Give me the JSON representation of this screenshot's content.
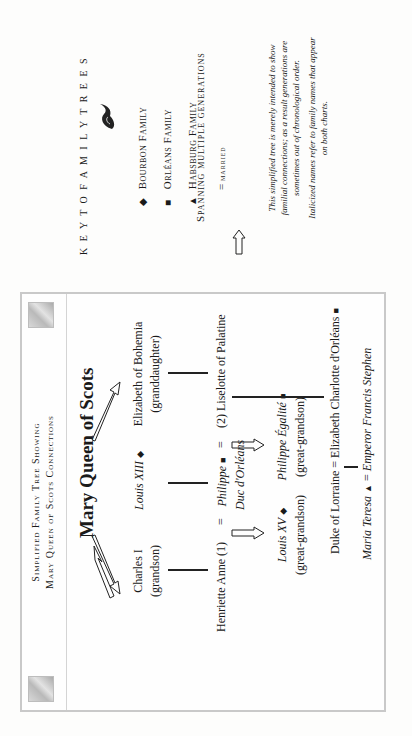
{
  "chart": {
    "title_line1": "Simplified Family Tree Showing",
    "title_line2": "Mary Queen of Scots Connections",
    "root": "Mary Queen of Scots",
    "people": {
      "charles": {
        "name": "Charles I",
        "relation": "(grandson)"
      },
      "louis13": {
        "name": "Louis XIII",
        "symbol": "◆"
      },
      "elizabeth_bohemia": {
        "name": "Elizabeth of Bohemia",
        "relation": "(granddaughter)"
      },
      "henriette": {
        "name": "Henriette Anne (1)"
      },
      "philippe": {
        "name": "Philippe",
        "symbol": "■",
        "title": "Duc d'Orléans"
      },
      "liselotte": {
        "name": "(2) Liselotte of Palatine"
      },
      "louis15": {
        "name": "Louis XV",
        "symbol": "◆",
        "relation": "(great-grandson)"
      },
      "philippe_egalite": {
        "name": "Philippe Égalité",
        "symbol": "■",
        "relation": "(great-grandson)"
      },
      "duke_lorraine": {
        "name": "Duke of Lorraine"
      },
      "elizabeth_charlotte": {
        "name": "Elizabeth Charlotte d'Orléans",
        "symbol": "■"
      },
      "maria_teresa": {
        "name": "Maria Teresa",
        "symbol": "▲"
      },
      "francis_stephen": {
        "name": "Emperor Francis Stephen"
      }
    },
    "married_sign": "="
  },
  "legend": {
    "title": "K E Y   T O   F A M I L Y   T R E E S",
    "items": [
      {
        "symbol": "◆",
        "label": "Bourbon Family"
      },
      {
        "symbol": "■",
        "label": "Orléans Family"
      },
      {
        "symbol": "▲",
        "label": "Habsburg Family"
      },
      {
        "symbol": "=",
        "label": "married"
      },
      {
        "symbol": "⇨",
        "label": "Spanning multiple generations"
      }
    ],
    "note1_line1": "This simplified tree is merely intended to show",
    "note1_line2": "familial connections; as a result generations are",
    "note1_line3": "sometimes out of chronological order.",
    "note2_line1": "Italicized names refer to family names that appear",
    "note2_line2": "on both charts."
  }
}
